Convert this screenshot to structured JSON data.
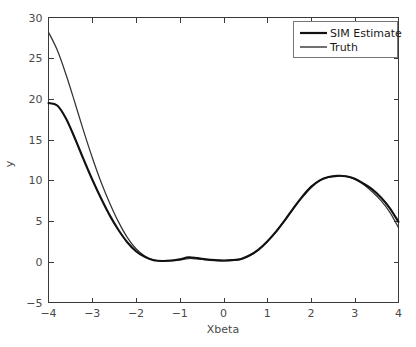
{
  "chart_data": {
    "type": "line",
    "title": "",
    "xlabel": "Xbeta",
    "ylabel": "y",
    "xlim": [
      -4,
      4
    ],
    "ylim": [
      -5,
      30
    ],
    "xticks": [
      -4,
      -3,
      -2,
      -1,
      0,
      1,
      2,
      3,
      4
    ],
    "xticklabels": [
      "−4",
      "−3",
      "−2",
      "−1",
      "0",
      "1",
      "2",
      "3",
      "4"
    ],
    "yticks": [
      -5,
      0,
      5,
      10,
      15,
      20,
      25,
      30
    ],
    "yticklabels": [
      "−5",
      "0",
      "5",
      "10",
      "15",
      "20",
      "25",
      "30"
    ],
    "grid": false,
    "legend_position": "top-right",
    "legend": [
      "SIM Estimate",
      "Truth"
    ],
    "colors": {
      "sim_estimate": "#111111",
      "truth": "#333333",
      "axis": "#3a3a3a",
      "background": "#ffffff"
    },
    "x": [
      -4.0,
      -3.8,
      -3.6,
      -3.4,
      -3.2,
      -3.0,
      -2.8,
      -2.6,
      -2.4,
      -2.2,
      -2.0,
      -1.8,
      -1.6,
      -1.4,
      -1.2,
      -1.0,
      -0.8,
      -0.6,
      -0.4,
      -0.2,
      0.0,
      0.2,
      0.4,
      0.6,
      0.8,
      1.0,
      1.2,
      1.4,
      1.6,
      1.8,
      2.0,
      2.2,
      2.4,
      2.6,
      2.8,
      3.0,
      3.2,
      3.4,
      3.6,
      3.8,
      4.0
    ],
    "series": [
      {
        "name": "SIM Estimate",
        "values": [
          19.5,
          19.2,
          17.6,
          15.2,
          12.6,
          10.1,
          7.8,
          5.7,
          3.9,
          2.4,
          1.3,
          0.6,
          0.2,
          0.1,
          0.15,
          0.3,
          0.55,
          0.45,
          0.3,
          0.2,
          0.15,
          0.2,
          0.35,
          0.8,
          1.5,
          2.5,
          3.7,
          5.1,
          6.6,
          8.0,
          9.2,
          10.0,
          10.4,
          10.55,
          10.5,
          10.2,
          9.6,
          8.9,
          7.9,
          6.6,
          4.9
        ]
      },
      {
        "name": "Truth",
        "values": [
          28.2,
          26.0,
          23.0,
          19.6,
          16.1,
          12.8,
          9.8,
          7.2,
          4.9,
          3.0,
          1.6,
          0.7,
          0.25,
          0.1,
          0.1,
          0.2,
          0.4,
          0.35,
          0.25,
          0.18,
          0.12,
          0.18,
          0.3,
          0.75,
          1.45,
          2.45,
          3.65,
          5.05,
          6.5,
          7.9,
          9.1,
          9.95,
          10.4,
          10.55,
          10.5,
          10.15,
          9.5,
          8.6,
          7.5,
          6.1,
          4.2
        ]
      }
    ]
  }
}
